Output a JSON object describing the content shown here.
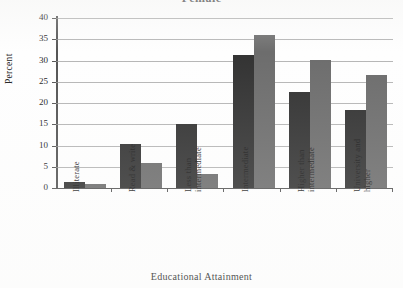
{
  "chart_data": {
    "type": "bar",
    "title": "Female",
    "xlabel": "Educational Attainment",
    "ylabel": "Percent",
    "ylim": [
      0,
      40
    ],
    "ytick_labels": [
      "0",
      "5",
      "10",
      "15",
      "20",
      "25",
      "30",
      "35",
      "40"
    ],
    "ytick_values": [
      0,
      5,
      10,
      15,
      20,
      25,
      30,
      35,
      40
    ],
    "grid": true,
    "legend": "none",
    "categories": [
      "Illiterate",
      "Read & write",
      "Less than\nintermediate",
      "Intermediate",
      "Higher than\nintermediate",
      "University and\nhigher"
    ],
    "series": [
      {
        "name": "series-1",
        "color": "#333333",
        "values": [
          1.4,
          10.4,
          15.0,
          31.2,
          22.7,
          18.4
        ]
      },
      {
        "name": "series-2",
        "color": "#6d6d6d",
        "values": [
          0.9,
          5.8,
          3.4,
          35.9,
          30.1,
          26.6
        ]
      }
    ]
  }
}
